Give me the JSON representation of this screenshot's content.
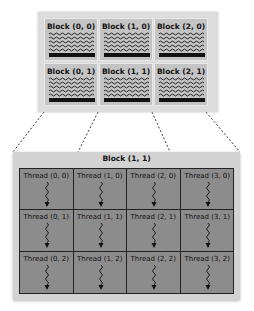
{
  "grid": {
    "blocks": [
      {
        "label": "Block (0, 0)"
      },
      {
        "label": "Block (1, 0)"
      },
      {
        "label": "Block (2, 0)"
      },
      {
        "label": "Block (0, 1)"
      },
      {
        "label": "Block (1, 1)"
      },
      {
        "label": "Block (2, 1)"
      }
    ]
  },
  "block_detail": {
    "title": "Block (1, 1)",
    "threads": [
      {
        "label": "Thread (0, 0)"
      },
      {
        "label": "Thread (1, 0)"
      },
      {
        "label": "Thread (2, 0)"
      },
      {
        "label": "Thread (3, 0)"
      },
      {
        "label": "Thread (0, 1)"
      },
      {
        "label": "Thread (1, 1)"
      },
      {
        "label": "Thread (2, 1)"
      },
      {
        "label": "Thread (3, 1)"
      },
      {
        "label": "Thread (0, 2)"
      },
      {
        "label": "Thread (1, 2)"
      },
      {
        "label": "Thread (2, 2)"
      },
      {
        "label": "Thread (3, 2)"
      }
    ]
  },
  "colors": {
    "grid_bg": "#dcdcdc",
    "block_cell": "#c4c4c4",
    "thread_bg": "#8c8c8c",
    "border": "#222222"
  }
}
